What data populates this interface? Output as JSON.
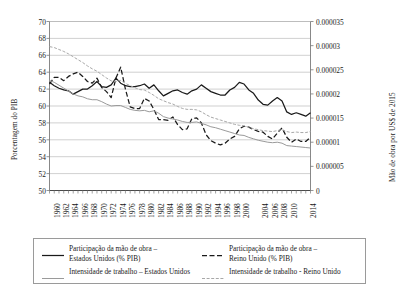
{
  "chart_data": {
    "type": "line",
    "title": "",
    "subtitle": "",
    "xlabel": "",
    "ylabel": "Porcentagem do PIB",
    "ylabel_secondary": "Mão de obra por US$ de 2015",
    "grid": true,
    "legend_position": "bottom",
    "xlim": [
      1960,
      2015
    ],
    "ylim": [
      50,
      70
    ],
    "ylim_secondary": [
      0,
      3.5e-05
    ],
    "ytick_labels": [
      "70",
      "68",
      "66",
      "64",
      "62",
      "60",
      "58",
      "56",
      "54",
      "52",
      "50"
    ],
    "ytick_values": [
      70,
      68,
      66,
      64,
      62,
      60,
      58,
      56,
      54,
      52,
      50
    ],
    "ytick_labels_secondary": [
      "0.000035",
      "0.00003",
      "0.000025",
      "0.00002",
      "0.000015",
      "0.00001",
      "0.000005",
      "0"
    ],
    "ytick_values_secondary": [
      3.5e-05,
      3e-05,
      2.5e-05,
      2e-05,
      1.5e-05,
      1e-05,
      5e-06,
      0
    ],
    "xtick_labels": [
      "1960",
      "1962",
      "1964",
      "1966",
      "1968",
      "1970",
      "1972",
      "1974",
      "1976",
      "1978",
      "1980",
      "1982",
      "1984",
      "1986",
      "1988",
      "1990",
      "1992",
      "1994",
      "1996",
      "1998",
      "2000",
      "2004",
      "2006",
      "2008",
      "2010",
      "2014"
    ],
    "xtick_values": [
      1960,
      1962,
      1964,
      1966,
      1968,
      1970,
      1972,
      1974,
      1976,
      1978,
      1980,
      1982,
      1984,
      1986,
      1988,
      1990,
      1992,
      1994,
      1996,
      1998,
      2000,
      2004,
      2006,
      2008,
      2010,
      2014
    ],
    "x": [
      1960,
      1961,
      1962,
      1963,
      1964,
      1965,
      1966,
      1967,
      1968,
      1969,
      1970,
      1971,
      1972,
      1973,
      1974,
      1975,
      1976,
      1977,
      1978,
      1979,
      1980,
      1981,
      1982,
      1983,
      1984,
      1985,
      1986,
      1987,
      1988,
      1989,
      1990,
      1991,
      1992,
      1993,
      1994,
      1995,
      1996,
      1997,
      1998,
      1999,
      2000,
      2001,
      2002,
      2003,
      2004,
      2005,
      2006,
      2007,
      2008,
      2009,
      2010,
      2011,
      2012,
      2013,
      2014,
      2015
    ],
    "series": [
      {
        "name": "Participação da mão de obra – Estados Unidos (% PIB)",
        "axis": "left",
        "style": "solid",
        "color": "#1a1a1a",
        "values": [
          62.8,
          62.4,
          62.1,
          61.9,
          61.8,
          61.4,
          61.7,
          62.0,
          62.0,
          62.4,
          62.9,
          62.3,
          62.2,
          62.5,
          63.3,
          62.7,
          62.4,
          62.3,
          62.3,
          62.4,
          62.6,
          62.1,
          62.5,
          61.8,
          61.2,
          61.5,
          61.8,
          61.9,
          61.6,
          61.4,
          61.8,
          62.0,
          62.5,
          62.1,
          61.7,
          61.5,
          61.3,
          61.3,
          61.9,
          62.2,
          62.8,
          62.6,
          61.9,
          61.5,
          60.7,
          60.2,
          60.1,
          60.6,
          61.0,
          60.6,
          59.3,
          59.0,
          59.2,
          59.0,
          58.8,
          59.2
        ]
      },
      {
        "name": "Participação da mão de obra – Reino Unido (% PIB)",
        "axis": "left",
        "style": "dashed",
        "color": "#1a1a1a",
        "values": [
          62.6,
          63.4,
          63.4,
          63.0,
          63.5,
          63.8,
          64.0,
          63.5,
          62.9,
          62.7,
          63.3,
          62.2,
          61.7,
          61.0,
          63.3,
          64.6,
          62.0,
          59.9,
          59.7,
          59.7,
          60.9,
          60.6,
          59.6,
          58.4,
          58.4,
          58.3,
          58.7,
          57.8,
          57.2,
          57.3,
          58.5,
          58.6,
          58.0,
          56.6,
          55.9,
          55.6,
          55.4,
          55.6,
          56.1,
          56.4,
          57.3,
          57.6,
          57.5,
          57.2,
          57.0,
          56.9,
          56.4,
          56.1,
          56.8,
          57.4,
          56.3,
          55.7,
          56.1,
          55.8,
          55.8,
          56.3
        ]
      },
      {
        "name": "Intensidade de trabalho – Estados Unidos",
        "axis": "right",
        "style": "solid-light",
        "color": "#a6a6a6",
        "values": [
          2.28e-05,
          2.24e-05,
          2.18e-05,
          2.12e-05,
          2.06e-05,
          2e-05,
          1.96e-05,
          1.94e-05,
          1.9e-05,
          1.88e-05,
          1.88e-05,
          1.84e-05,
          1.79e-05,
          1.75e-05,
          1.76e-05,
          1.76e-05,
          1.72e-05,
          1.68e-05,
          1.66e-05,
          1.65e-05,
          1.66e-05,
          1.63e-05,
          1.65e-05,
          1.6e-05,
          1.53e-05,
          1.5e-05,
          1.48e-05,
          1.46e-05,
          1.43e-05,
          1.41e-05,
          1.41e-05,
          1.42e-05,
          1.39e-05,
          1.36e-05,
          1.32e-05,
          1.3e-05,
          1.27e-05,
          1.24e-05,
          1.21e-05,
          1.18e-05,
          1.15e-05,
          1.14e-05,
          1.1e-05,
          1.07e-05,
          1.04e-05,
          1.02e-05,
          1e-05,
          9.9e-06,
          1e-05,
          9.8e-06,
          9.3e-06,
          9.2e-06,
          9.1e-06,
          9e-06,
          8.9e-06,
          8.8e-06
        ]
      },
      {
        "name": "Intensidade de trabalho – Reino Unido",
        "axis": "right",
        "style": "dotted-light",
        "color": "#a6a6a6",
        "values": [
          2.98e-05,
          2.96e-05,
          2.92e-05,
          2.88e-05,
          2.83e-05,
          2.77e-05,
          2.71e-05,
          2.65e-05,
          2.58e-05,
          2.52e-05,
          2.47e-05,
          2.4e-05,
          2.33e-05,
          2.27e-05,
          2.26e-05,
          2.28e-05,
          2.22e-05,
          2.17e-05,
          2.13e-05,
          2.09e-05,
          2.08e-05,
          2.03e-05,
          1.97e-05,
          1.9e-05,
          1.86e-05,
          1.82e-05,
          1.79e-05,
          1.74e-05,
          1.7e-05,
          1.68e-05,
          1.68e-05,
          1.67e-05,
          1.63e-05,
          1.57e-05,
          1.52e-05,
          1.49e-05,
          1.46e-05,
          1.43e-05,
          1.4e-05,
          1.37e-05,
          1.35e-05,
          1.34e-05,
          1.31e-05,
          1.28e-05,
          1.26e-05,
          1.24e-05,
          1.23e-05,
          1.22e-05,
          1.24e-05,
          1.26e-05,
          1.22e-05,
          1.2e-05,
          1.21e-05,
          1.2e-05,
          1.2e-05,
          1.22e-05
        ]
      }
    ],
    "legend": [
      {
        "label": "Participação da mão de obra –\nEstados Unidos (% PIB)",
        "style": "solid",
        "color": "#1a1a1a"
      },
      {
        "label": "Participação da mão de obra –\nReino Unido (% PIB)",
        "style": "dashed",
        "color": "#1a1a1a"
      },
      {
        "label": "Intensidade de trabalho – Estados Unidos",
        "style": "solid-light",
        "color": "#a6a6a6"
      },
      {
        "label": "Intensidade de trabalho - Reino Unido",
        "style": "dotted-light",
        "color": "#a6a6a6"
      }
    ]
  }
}
